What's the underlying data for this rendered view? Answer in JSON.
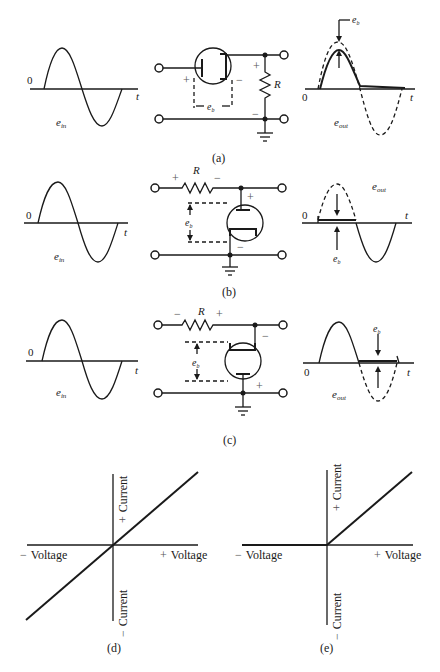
{
  "figure": {
    "panels": [
      {
        "id": "a",
        "caption": "(a)",
        "input_wave": {
          "origin_label": "0",
          "axis_label": "t",
          "signal_label": "e",
          "signal_sub": "in"
        },
        "circuit": {
          "resistor_label": "R",
          "drop_label": "e",
          "drop_sub": "b",
          "plus": "+",
          "minus": "−",
          "config": "series diode, shunt resistor output"
        },
        "output_wave": {
          "origin_label": "0",
          "axis_label": "t",
          "signal_label": "e",
          "signal_sub": "out",
          "drop_label": "e",
          "drop_sub": "b"
        }
      },
      {
        "id": "b",
        "caption": "(b)",
        "input_wave": {
          "origin_label": "0",
          "axis_label": "t",
          "signal_label": "e",
          "signal_sub": "in"
        },
        "circuit": {
          "resistor_label": "R",
          "drop_label": "e",
          "drop_sub": "b",
          "plus": "+",
          "minus": "−",
          "config": "series resistor, shunt diode (clips positive)"
        },
        "output_wave": {
          "origin_label": "0",
          "axis_label": "t",
          "signal_label": "e",
          "signal_sub": "out",
          "drop_label": "e",
          "drop_sub": "b"
        }
      },
      {
        "id": "c",
        "caption": "(c)",
        "input_wave": {
          "origin_label": "0",
          "axis_label": "t",
          "signal_label": "e",
          "signal_sub": "in"
        },
        "circuit": {
          "resistor_label": "R",
          "drop_label": "e",
          "drop_sub": "b",
          "plus": "+",
          "minus": "−",
          "config": "series resistor, shunt diode (clips negative)"
        },
        "output_wave": {
          "origin_label": "0",
          "axis_label": "t",
          "signal_label": "e",
          "signal_sub": "out",
          "drop_label": "e",
          "drop_sub": "b"
        }
      }
    ],
    "graphs": [
      {
        "id": "d",
        "caption": "(d)",
        "x_neg_label": "Voltage",
        "x_pos_label": "Voltage",
        "y_pos_label": "Current",
        "y_neg_label": "Current",
        "plus": "+",
        "minus": "−",
        "characteristic": "linear (resistor)"
      },
      {
        "id": "e",
        "caption": "(e)",
        "x_neg_label": "Voltage",
        "x_pos_label": "Voltage",
        "y_pos_label": "Current",
        "y_neg_label": "Current",
        "plus": "+",
        "minus": "−",
        "characteristic": "ideal diode"
      }
    ]
  }
}
